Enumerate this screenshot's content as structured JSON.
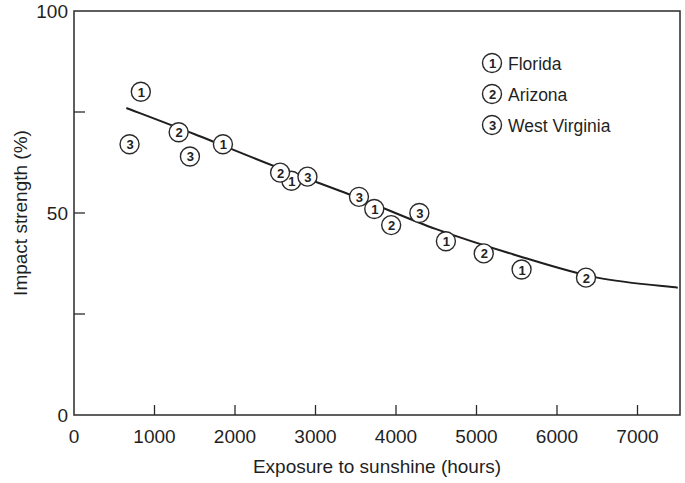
{
  "chart_data": {
    "type": "scatter",
    "title": "",
    "xlabel": "Exposure to sunshine (hours)",
    "ylabel": "Impact strength (%)",
    "xlim": [
      0,
      7500
    ],
    "ylim": [
      0,
      100
    ],
    "x_ticks": [
      0,
      1000,
      2000,
      3000,
      4000,
      5000,
      6000,
      7000
    ],
    "x_tick_labels": [
      "0",
      "1000",
      "2000",
      "3000",
      "4000",
      "5000",
      "6000",
      "7000"
    ],
    "y_ticks": [
      0,
      25,
      50,
      75,
      100
    ],
    "y_tick_labels": [
      "0",
      "",
      "50",
      "",
      "100"
    ],
    "grid": false,
    "legend_position": "upper right",
    "legend": [
      {
        "marker": "1",
        "label": "Florida"
      },
      {
        "marker": "2",
        "label": "Arizona"
      },
      {
        "marker": "3",
        "label": "West Virginia"
      }
    ],
    "series": [
      {
        "name": "Florida",
        "marker": "1",
        "points": [
          [
            830,
            80
          ],
          [
            1850,
            67
          ],
          [
            2700,
            58
          ],
          [
            3730,
            51
          ],
          [
            4620,
            43
          ],
          [
            5560,
            36
          ]
        ]
      },
      {
        "name": "Arizona",
        "marker": "2",
        "points": [
          [
            1300,
            70
          ],
          [
            2560,
            60
          ],
          [
            3940,
            47
          ],
          [
            5090,
            40
          ],
          [
            6360,
            34
          ]
        ]
      },
      {
        "name": "West Virginia",
        "marker": "3",
        "points": [
          [
            690,
            67
          ],
          [
            1440,
            64
          ],
          [
            2900,
            59
          ],
          [
            3540,
            54
          ],
          [
            4290,
            50
          ]
        ]
      }
    ],
    "fit_curve": {
      "type": "smooth trend line",
      "points": [
        [
          650,
          76
        ],
        [
          1500,
          69.5
        ],
        [
          2500,
          61.5
        ],
        [
          3500,
          54
        ],
        [
          4500,
          46
        ],
        [
          5500,
          39.5
        ],
        [
          6500,
          34
        ],
        [
          7500,
          31.5
        ]
      ]
    }
  }
}
